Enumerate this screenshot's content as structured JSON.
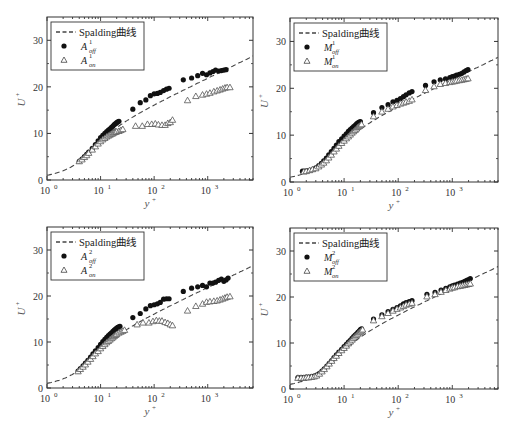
{
  "chart_data": [
    {
      "type": "scatter",
      "panel": "top-left",
      "xlabel": "y+",
      "ylabel": "U+",
      "xscale": "log",
      "xlim": [
        1,
        7000
      ],
      "ylim": [
        0,
        35
      ],
      "xticks": [
        "10^0",
        "10^1",
        "10^2",
        "10^3"
      ],
      "yticks": [
        0,
        10,
        20,
        30
      ],
      "legend": {
        "position": "upper left",
        "entries": [
          "Spalding曲线",
          "A_off^1",
          "A_on^1"
        ]
      },
      "series": [
        {
          "name": "A_off^1",
          "marker": "filled-circle",
          "x": [
            4,
            4.5,
            5,
            5.5,
            6,
            7,
            8,
            9,
            10,
            11,
            12,
            13,
            14,
            15,
            16,
            17,
            18,
            19,
            20,
            21,
            22,
            40,
            55,
            70,
            85,
            100,
            115,
            130,
            150,
            170,
            190,
            350,
            500,
            650,
            800,
            950,
            1100,
            1250,
            1400,
            1600,
            1800,
            2000,
            2200
          ],
          "y": [
            4,
            4.5,
            5,
            5.5,
            6,
            6.8,
            7.6,
            8.4,
            9.1,
            9.6,
            10.0,
            10.4,
            10.7,
            11.0,
            11.3,
            11.6,
            11.9,
            12.1,
            12.3,
            12.5,
            12.6,
            15.2,
            16.6,
            17.2,
            18.1,
            18.5,
            18.6,
            18.8,
            19.2,
            19.5,
            19.7,
            21.5,
            21.9,
            22.4,
            22.9,
            22.6,
            23.0,
            23.3,
            23.6,
            23.4,
            23.5,
            23.6,
            23.7
          ]
        },
        {
          "name": "A_on^1",
          "marker": "open-triangle",
          "x": [
            4,
            4.5,
            5,
            5.5,
            6,
            7,
            8,
            9,
            10,
            11,
            12,
            13,
            14,
            15,
            16,
            17,
            18,
            19,
            20,
            22,
            24,
            26,
            45,
            60,
            75,
            90,
            105,
            120,
            140,
            160,
            180,
            200,
            220,
            420,
            600,
            800,
            950,
            1100,
            1300,
            1500,
            1700,
            1900,
            2100,
            2300,
            2600
          ],
          "y": [
            4,
            4.4,
            4.9,
            5.3,
            5.8,
            6.5,
            7.2,
            7.8,
            8.3,
            8.7,
            9.0,
            9.3,
            9.5,
            9.7,
            9.9,
            10.0,
            10.2,
            10.3,
            10.4,
            10.5,
            10.7,
            10.9,
            11.6,
            11.6,
            12.0,
            12.0,
            12.1,
            11.9,
            11.8,
            11.8,
            12.2,
            12.4,
            12.9,
            17.1,
            18.0,
            18.3,
            18.5,
            18.7,
            19.0,
            19.2,
            19.4,
            19.6,
            19.8,
            19.9,
            19.9
          ]
        },
        {
          "name": "Spalding曲线",
          "type": "line",
          "style": "dashed"
        }
      ]
    },
    {
      "type": "scatter",
      "panel": "top-right",
      "xlabel": "y+",
      "ylabel": "U+",
      "xscale": "log",
      "xlim": [
        1,
        7000
      ],
      "ylim": [
        0,
        35
      ],
      "xticks": [
        "10^0",
        "10^1",
        "10^2",
        "10^3"
      ],
      "yticks": [
        0,
        10,
        20,
        30
      ],
      "legend": {
        "position": "upper left",
        "entries": [
          "Spalding曲线",
          "M_off^1",
          "M_on^1"
        ]
      },
      "series": [
        {
          "name": "M_off^1",
          "marker": "filled-circle",
          "x": [
            1.7,
            1.9,
            2.1,
            2.4,
            2.7,
            3,
            3.4,
            3.8,
            4.2,
            4.7,
            5.2,
            5.8,
            6.5,
            7.2,
            8,
            9,
            10,
            11,
            12,
            13,
            14,
            15,
            16,
            17,
            18,
            19,
            20,
            35,
            50,
            65,
            80,
            95,
            110,
            125,
            140,
            160,
            180,
            320,
            460,
            600,
            750,
            900,
            1000,
            1100,
            1200,
            1350,
            1500,
            1650,
            1800,
            1950
          ],
          "y": [
            2.3,
            2.3,
            2.4,
            2.5,
            2.7,
            3.0,
            3.5,
            4.0,
            4.5,
            5.1,
            5.8,
            6.5,
            7.2,
            7.9,
            8.6,
            9.2,
            9.8,
            10.3,
            10.8,
            11.2,
            11.5,
            11.8,
            12.1,
            12.4,
            12.6,
            12.8,
            12.9,
            14.8,
            15.9,
            16.5,
            17.1,
            17.4,
            17.8,
            18.2,
            18.6,
            19.0,
            19.3,
            20.6,
            21.4,
            21.8,
            22.0,
            22.3,
            22.5,
            22.6,
            22.8,
            23.0,
            23.2,
            23.5,
            23.8,
            24.0
          ]
        },
        {
          "name": "M_on^1",
          "marker": "open-triangle",
          "x": [
            1.8,
            2,
            2.3,
            2.6,
            3,
            3.4,
            3.8,
            4.2,
            4.7,
            5.2,
            5.8,
            6.5,
            7.2,
            8,
            9,
            10,
            11,
            12,
            13,
            14,
            15,
            16,
            17,
            18,
            19,
            20,
            21,
            35,
            50,
            65,
            80,
            95,
            110,
            125,
            140,
            160,
            180,
            320,
            460,
            600,
            750,
            900,
            1000,
            1100,
            1200,
            1350,
            1500,
            1650,
            1800,
            1950
          ],
          "y": [
            2.2,
            2.3,
            2.5,
            2.7,
            2.9,
            3.3,
            3.7,
            4.1,
            4.6,
            5.2,
            5.8,
            6.5,
            7.1,
            7.7,
            8.3,
            8.8,
            9.3,
            9.7,
            10.1,
            10.5,
            10.8,
            11.1,
            11.4,
            11.7,
            11.9,
            12.1,
            12.3,
            14.0,
            15.0,
            15.6,
            16.1,
            16.4,
            16.7,
            16.9,
            17.1,
            17.3,
            17.6,
            19.6,
            20.4,
            20.9,
            21.1,
            21.3,
            21.4,
            21.5,
            21.6,
            21.7,
            21.8,
            21.9,
            22.0,
            22.1
          ]
        },
        {
          "name": "Spalding曲线",
          "type": "line",
          "style": "dashed"
        }
      ]
    },
    {
      "type": "scatter",
      "panel": "bottom-left",
      "xlabel": "y+",
      "ylabel": "U+",
      "xscale": "log",
      "xlim": [
        1,
        7000
      ],
      "ylim": [
        0,
        35
      ],
      "xticks": [
        "10^0",
        "10^1",
        "10^2",
        "10^3"
      ],
      "yticks": [
        0,
        10,
        20,
        30
      ],
      "legend": {
        "position": "upper left",
        "entries": [
          "Spalding曲线",
          "A_off^2",
          "A_on^2"
        ]
      },
      "series": [
        {
          "name": "A_off^2",
          "marker": "filled-circle",
          "x": [
            3.8,
            4.2,
            4.7,
            5.2,
            5.8,
            6.5,
            7.2,
            8,
            9,
            10,
            11,
            12,
            13,
            14,
            15,
            16,
            17,
            18,
            19,
            20,
            21,
            22,
            23,
            40,
            55,
            70,
            85,
            100,
            115,
            130,
            150,
            170,
            190,
            350,
            500,
            650,
            800,
            950,
            1100,
            1250,
            1400,
            1600,
            1800,
            2000,
            2200,
            2400
          ],
          "y": [
            3.7,
            4.2,
            4.8,
            5.4,
            6.0,
            6.7,
            7.4,
            8.1,
            8.8,
            9.5,
            10.1,
            10.6,
            11.0,
            11.4,
            11.7,
            12.0,
            12.3,
            12.6,
            12.8,
            13.0,
            13.2,
            13.3,
            13.4,
            15.3,
            16.2,
            17.2,
            17.9,
            18.1,
            18.3,
            18.6,
            19.3,
            19.4,
            19.4,
            21.0,
            21.7,
            22.0,
            22.3,
            22.0,
            22.8,
            22.8,
            23.0,
            23.4,
            23.7,
            23.2,
            23.5,
            23.9
          ]
        },
        {
          "name": "A_on^2",
          "marker": "open-triangle",
          "x": [
            3.8,
            4.2,
            4.7,
            5.2,
            5.8,
            6.5,
            7.2,
            8,
            9,
            10,
            11,
            12,
            13,
            14,
            15,
            16,
            17,
            18,
            19,
            20,
            22,
            24,
            26,
            28,
            48,
            62,
            80,
            95,
            110,
            125,
            140,
            160,
            180,
            200,
            220,
            420,
            600,
            800,
            950,
            1100,
            1300,
            1500,
            1700,
            1900,
            2100,
            2300,
            2600
          ],
          "y": [
            3.6,
            4.1,
            4.6,
            5.1,
            5.7,
            6.3,
            6.9,
            7.5,
            8.0,
            8.6,
            9.1,
            9.5,
            9.9,
            10.2,
            10.5,
            10.8,
            11.0,
            11.3,
            11.5,
            11.7,
            12.0,
            12.2,
            12.4,
            12.6,
            13.8,
            14.2,
            14.2,
            14.5,
            14.7,
            14.6,
            14.6,
            14.3,
            14.1,
            13.8,
            13.6,
            16.8,
            17.8,
            18.3,
            18.7,
            18.8,
            18.9,
            19.0,
            19.2,
            19.4,
            19.6,
            19.8,
            19.9
          ]
        },
        {
          "name": "Spalding曲线",
          "type": "line",
          "style": "dashed"
        }
      ]
    },
    {
      "type": "scatter",
      "panel": "bottom-right",
      "xlabel": "y+",
      "ylabel": "U+",
      "xscale": "log",
      "xlim": [
        1,
        7000
      ],
      "ylim": [
        0,
        35
      ],
      "xticks": [
        "10^0",
        "10^1",
        "10^2",
        "10^3"
      ],
      "yticks": [
        0,
        10,
        20,
        30
      ],
      "legend": {
        "position": "upper left",
        "entries": [
          "Spalding曲线",
          "M_off^2",
          "M_on^2"
        ]
      },
      "series": [
        {
          "name": "M_off^2",
          "marker": "filled-circle",
          "x": [
            1.4,
            1.6,
            1.8,
            2.0,
            2.2,
            2.5,
            2.8,
            3.1,
            3.5,
            3.9,
            4.3,
            4.8,
            5.3,
            5.9,
            6.5,
            7.2,
            8,
            9,
            10,
            11,
            12,
            13,
            14,
            15,
            16,
            17,
            18,
            19,
            20,
            21,
            35,
            50,
            65,
            80,
            95,
            110,
            125,
            140,
            160,
            180,
            340,
            480,
            620,
            760,
            900,
            1000,
            1100,
            1250,
            1400,
            1550,
            1700,
            1850,
            2000,
            2150
          ],
          "y": [
            2.5,
            2.5,
            2.5,
            2.6,
            2.6,
            2.7,
            2.8,
            3.0,
            3.4,
            3.9,
            4.4,
            5.0,
            5.6,
            6.2,
            6.8,
            7.4,
            8.0,
            8.6,
            9.2,
            9.7,
            10.2,
            10.6,
            11.0,
            11.4,
            11.7,
            12.0,
            12.3,
            12.6,
            12.9,
            13.1,
            15.2,
            16.1,
            16.8,
            17.3,
            17.7,
            18.1,
            18.5,
            18.8,
            19.0,
            19.2,
            20.6,
            21.0,
            21.5,
            21.9,
            22.2,
            22.4,
            22.6,
            22.8,
            23.0,
            23.2,
            23.4,
            23.6,
            23.8,
            24.0
          ]
        },
        {
          "name": "M_on^2",
          "marker": "open-triangle",
          "x": [
            1.4,
            1.6,
            1.8,
            2.0,
            2.2,
            2.5,
            2.8,
            3.1,
            3.5,
            3.9,
            4.3,
            4.8,
            5.3,
            5.9,
            6.5,
            7.2,
            8,
            9,
            10,
            11,
            12,
            13,
            14,
            15,
            16,
            17,
            18,
            19,
            20,
            21,
            22,
            35,
            50,
            65,
            80,
            95,
            110,
            125,
            140,
            160,
            180,
            340,
            480,
            620,
            760,
            900,
            1000,
            1100,
            1250,
            1400,
            1550,
            1700,
            1850,
            2000,
            2150
          ],
          "y": [
            2.4,
            2.4,
            2.4,
            2.5,
            2.5,
            2.6,
            2.7,
            2.9,
            3.3,
            3.8,
            4.3,
            4.9,
            5.5,
            6.1,
            6.7,
            7.2,
            7.8,
            8.4,
            8.9,
            9.4,
            9.9,
            10.3,
            10.7,
            11.1,
            11.4,
            11.7,
            12.0,
            12.3,
            12.5,
            12.7,
            12.9,
            14.9,
            15.8,
            16.5,
            17.0,
            17.4,
            17.7,
            18.0,
            18.3,
            18.5,
            18.7,
            20.1,
            20.6,
            21.1,
            21.5,
            21.8,
            22.0,
            22.1,
            22.3,
            22.4,
            22.5,
            22.6,
            22.7,
            22.8,
            22.9
          ]
        },
        {
          "name": "Spalding曲线",
          "type": "line",
          "style": "dashed"
        }
      ]
    }
  ],
  "panels": [
    {
      "ylabel": "U",
      "ylabel_sup": "+",
      "xlabel": "y",
      "xlabel_sup": "+",
      "legend_line": "Spalding曲线",
      "legend_off": {
        "base": "A",
        "sup": "1",
        "sub": "off"
      },
      "legend_on": {
        "base": "A",
        "sup": "1",
        "sub": "on"
      }
    },
    {
      "ylabel": "U",
      "ylabel_sup": "+",
      "xlabel": "y",
      "xlabel_sup": "+",
      "legend_line": "Spalding曲线",
      "legend_off": {
        "base": "M",
        "sup": "1",
        "sub": "off"
      },
      "legend_on": {
        "base": "M",
        "sup": "1",
        "sub": "on"
      }
    },
    {
      "ylabel": "U",
      "ylabel_sup": "+",
      "xlabel": "y",
      "xlabel_sup": "+",
      "legend_line": "Spalding曲线",
      "legend_off": {
        "base": "A",
        "sup": "2",
        "sub": "off"
      },
      "legend_on": {
        "base": "A",
        "sup": "2",
        "sub": "on"
      }
    },
    {
      "ylabel": "U",
      "ylabel_sup": "+",
      "xlabel": "y",
      "xlabel_sup": "+",
      "legend_line": "Spalding曲线",
      "legend_off": {
        "base": "M",
        "sup": "2",
        "sub": "off"
      },
      "legend_on": {
        "base": "M",
        "sup": "2",
        "sub": "on"
      }
    }
  ],
  "axis": {
    "ytick_labels": [
      "0",
      "10",
      "20",
      "30"
    ],
    "xtick_labels": [
      {
        "base": "10",
        "exp": "0"
      },
      {
        "base": "10",
        "exp": "1"
      },
      {
        "base": "10",
        "exp": "2"
      },
      {
        "base": "10",
        "exp": "3"
      }
    ]
  },
  "colors": {
    "axis": "#333333",
    "marker": "#111111",
    "dash": "#444444",
    "text": "#333333"
  }
}
